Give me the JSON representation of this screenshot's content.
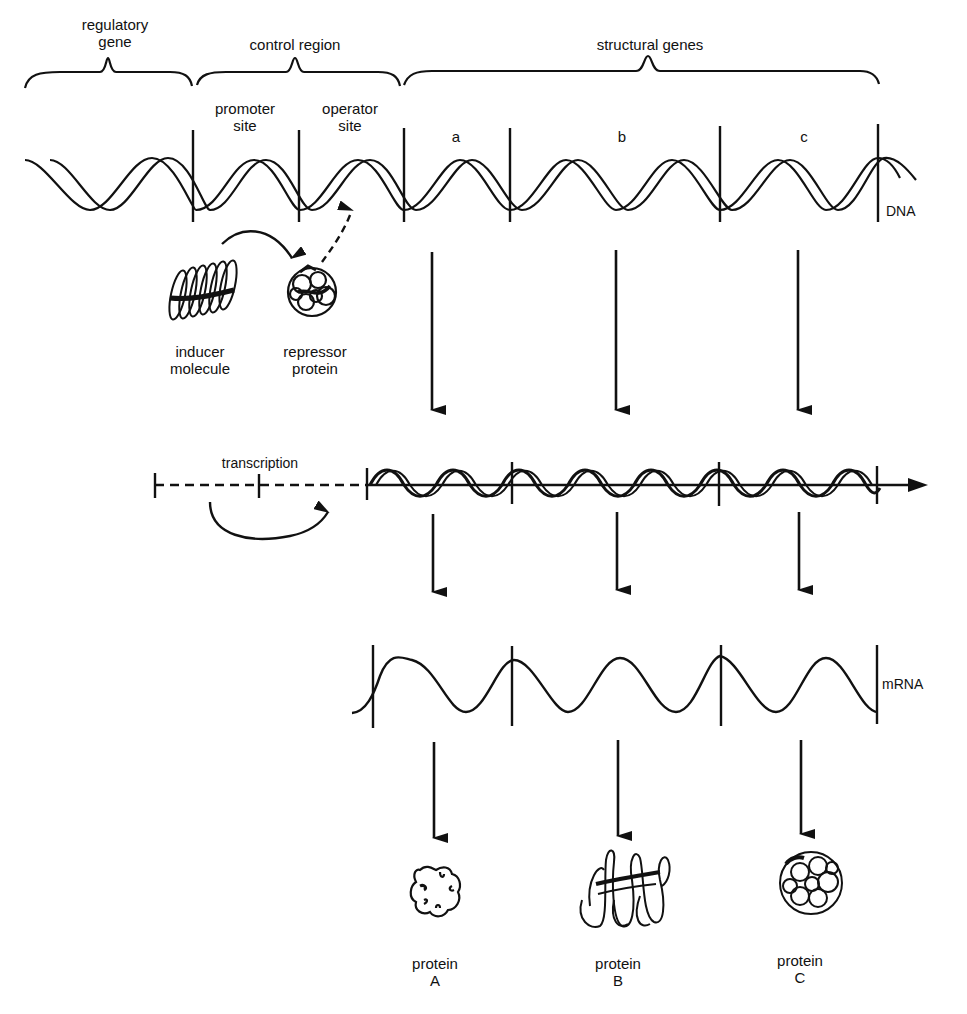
{
  "colors": {
    "ink": "#111111",
    "background": "#ffffff"
  },
  "brackets": {
    "regulatory_gene": "regulatory\ngene",
    "control_region": "control region",
    "structural_genes": "structural genes"
  },
  "sites": {
    "promoter": "promoter\nsite",
    "operator": "operator\nsite"
  },
  "genes": [
    "a",
    "b",
    "c"
  ],
  "dna_label": "DNA",
  "molecules": {
    "inducer": "inducer\nmolecule",
    "repressor": "repressor\nprotein"
  },
  "transcription_label": "transcription",
  "mrna_label": "mRNA",
  "proteins": [
    {
      "label": "protein\nA",
      "icon": "protein-a-globular-icon"
    },
    {
      "label": "protein\nB",
      "icon": "protein-b-fibrous-icon"
    },
    {
      "label": "protein\nC",
      "icon": "protein-c-dense-globular-icon"
    }
  ]
}
